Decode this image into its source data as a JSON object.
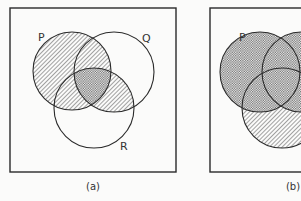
{
  "figures": [
    {
      "id": "a",
      "caption": "(a)",
      "sets": [
        {
          "name": "P",
          "label": "P"
        },
        {
          "name": "Q",
          "label": "Q"
        },
        {
          "name": "R",
          "label": "R"
        }
      ],
      "shaded_regions": [
        {
          "expression": "P",
          "pattern": "diagonal-hatch"
        },
        {
          "expression": "Q ∩ R",
          "pattern": "diagonal-hatch"
        },
        {
          "expression": "P ∩ Q ∩ R",
          "pattern": "cross-hatch"
        }
      ]
    },
    {
      "id": "b",
      "caption": "(b)",
      "sets": [
        {
          "name": "P",
          "label": "P"
        },
        {
          "name": "Q",
          "label": ""
        },
        {
          "name": "R",
          "label": ""
        }
      ],
      "shaded_regions": [
        {
          "expression": "P ∪ Q",
          "pattern": "cross-hatch"
        },
        {
          "expression": "R − (P ∪ Q)",
          "pattern": "diagonal-hatch"
        }
      ]
    }
  ],
  "colors": {
    "line": "#2a2a2a",
    "hatch": "#555555",
    "background": "#fbfbfa"
  }
}
